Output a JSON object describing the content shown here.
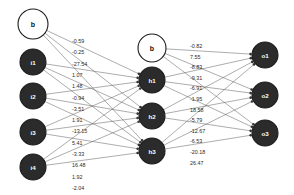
{
  "diagram": {
    "type": "feedforward-neural-network",
    "background_color": "#ffffff",
    "edge_color": "#5a5a5a",
    "node_dark_color": "#2b2b2b",
    "node_light_color": "#ffffff",
    "node_border_color": "#1c1c1c",
    "label_color": "#2a2a2a"
  },
  "layers": {
    "input": {
      "name": "input-layer",
      "bias": {
        "label": "b",
        "style": "light",
        "cx": 33,
        "cy": 24,
        "r": 15
      },
      "nodes": [
        {
          "label": "i1",
          "style": "dark",
          "cx": 33,
          "cy": 62,
          "r": 13
        },
        {
          "label": "i2",
          "style": "dark",
          "cx": 33,
          "cy": 96,
          "r": 13
        },
        {
          "label": "i3",
          "style": "dark",
          "cx": 33,
          "cy": 132,
          "r": 13
        },
        {
          "label": "i4",
          "style": "dark",
          "cx": 33,
          "cy": 167,
          "r": 13
        }
      ]
    },
    "hidden": {
      "name": "hidden-layer",
      "bias": {
        "label": "b",
        "style": "light",
        "cx": 152,
        "cy": 48,
        "r": 14
      },
      "nodes": [
        {
          "label": "h1",
          "style": "dark",
          "cx": 152,
          "cy": 80,
          "r": 13
        },
        {
          "label": "h2",
          "style": "dark",
          "cx": 152,
          "cy": 116,
          "r": 13
        },
        {
          "label": "h3",
          "style": "dark",
          "cx": 152,
          "cy": 151,
          "r": 13
        }
      ]
    },
    "output": {
      "name": "output-layer",
      "nodes": [
        {
          "label": "o1",
          "style": "dark",
          "cx": 265,
          "cy": 55,
          "r": 13
        },
        {
          "label": "o2",
          "style": "dark",
          "cx": 265,
          "cy": 95,
          "r": 13
        },
        {
          "label": "o3",
          "style": "dark",
          "cx": 265,
          "cy": 133,
          "r": 13
        }
      ]
    }
  },
  "weights": {
    "input_to_hidden": {
      "name": "input-to-hidden-weights",
      "x": 72,
      "start_y": 41,
      "step": 11.3,
      "values": [
        "-0.59",
        "-0.25",
        "-27.54",
        "1.07",
        "1.48",
        "-0.94",
        "-3.51",
        "1.91",
        "-13.15",
        "5.41",
        "-3.33",
        "16.48",
        "1.92",
        "-2.04",
        "23.23"
      ]
    },
    "hidden_to_output": {
      "name": "hidden-to-output-weights",
      "x": 190,
      "start_y": 46,
      "step": 10.6,
      "values": [
        "-0.82",
        "7.55",
        "-8.83",
        "-9.31",
        "-6.91",
        "-1.95",
        "18.58",
        "-5.79",
        "-12.67",
        "-6.53",
        "-20.18",
        "26.47"
      ]
    }
  }
}
